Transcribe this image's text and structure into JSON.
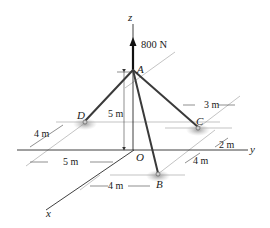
{
  "figure": {
    "force_label": "800 N",
    "axes": {
      "x": "x",
      "y": "y",
      "z": "z"
    },
    "points": {
      "A": "A",
      "B": "B",
      "C": "C",
      "D": "D",
      "O": "O"
    },
    "dimensions": {
      "height_A": "5 m",
      "D_x_offset": "4 m",
      "D_y_offset": "5 m",
      "B_y_offset": "4 m",
      "B_x_offset": "4 m",
      "C_y_offset": "3 m",
      "C_x_offset": "2 m"
    },
    "colors": {
      "member": "#3a3a3a",
      "axis": "#2a2a2a",
      "dimension": "#444444",
      "support_shadow": "#9a9a9a"
    }
  }
}
